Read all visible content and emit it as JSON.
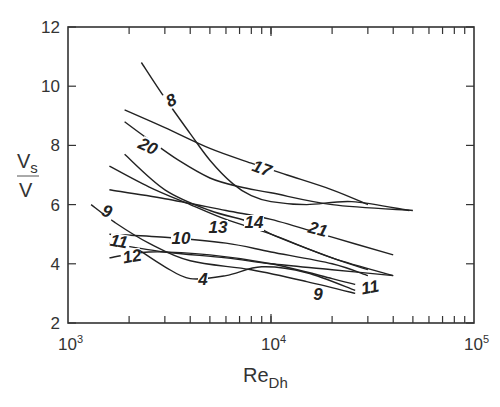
{
  "chart_data": {
    "type": "line",
    "title": "",
    "xlabel": "Re_Dh",
    "xlabel_main": "Re",
    "xlabel_sub": "Dh",
    "ylabel": "Vs/V",
    "ylabel_num": "V",
    "ylabel_num_sub": "s",
    "ylabel_den": "V",
    "xscale": "log",
    "xlim": [
      1000,
      100000
    ],
    "ylim": [
      2,
      12
    ],
    "xticks": [
      {
        "value": 1000,
        "base": "10",
        "exp": "3"
      },
      {
        "value": 10000,
        "base": "10",
        "exp": "4"
      },
      {
        "value": 100000,
        "base": "10",
        "exp": "5"
      }
    ],
    "yticks": [
      "2",
      "4",
      "6",
      "8",
      "10",
      "12"
    ],
    "grid": false,
    "legend": "none (curves labeled inline)",
    "series": [
      {
        "name": "8",
        "points": [
          [
            2300,
            10.8
          ],
          [
            3000,
            9.6
          ],
          [
            4000,
            8.4
          ],
          [
            5000,
            7.5
          ],
          [
            6500,
            6.7
          ],
          [
            8000,
            6.3
          ],
          [
            10000,
            6.1
          ],
          [
            15000,
            6.0
          ],
          [
            25000,
            6.1
          ],
          [
            48000,
            5.8
          ]
        ]
      },
      {
        "name": "17",
        "points": [
          [
            1900,
            9.2
          ],
          [
            3000,
            8.6
          ],
          [
            5000,
            7.9
          ],
          [
            8000,
            7.4
          ],
          [
            12000,
            7.0
          ],
          [
            20000,
            6.5
          ],
          [
            30000,
            6.0
          ]
        ]
      },
      {
        "name": "20",
        "points": [
          [
            1900,
            8.8
          ],
          [
            2500,
            8.2
          ],
          [
            3500,
            7.5
          ],
          [
            5000,
            6.9
          ],
          [
            7000,
            6.6
          ],
          [
            10000,
            6.4
          ],
          [
            20000,
            6.0
          ],
          [
            50000,
            5.8
          ]
        ]
      },
      {
        "name": "21",
        "points": [
          [
            1600,
            6.5
          ],
          [
            3000,
            6.2
          ],
          [
            6000,
            5.8
          ],
          [
            10000,
            5.5
          ],
          [
            20000,
            4.9
          ],
          [
            40000,
            4.3
          ]
        ]
      },
      {
        "name": "14",
        "points": [
          [
            1900,
            7.7
          ],
          [
            3000,
            6.5
          ],
          [
            5000,
            5.8
          ],
          [
            8000,
            5.4
          ],
          [
            10000,
            5.0
          ],
          [
            20000,
            4.2
          ],
          [
            30000,
            3.8
          ]
        ]
      },
      {
        "name": "13",
        "points": [
          [
            1600,
            7.3
          ],
          [
            2500,
            6.6
          ],
          [
            4000,
            6.0
          ],
          [
            6000,
            5.5
          ],
          [
            10000,
            5.0
          ],
          [
            20000,
            4.2
          ],
          [
            40000,
            3.6
          ]
        ]
      },
      {
        "name": "9",
        "points": [
          [
            1300,
            6.0
          ],
          [
            1700,
            5.4
          ],
          [
            2500,
            4.7
          ],
          [
            4000,
            4.1
          ],
          [
            8000,
            3.8
          ],
          [
            15000,
            3.4
          ],
          [
            26000,
            3.0
          ]
        ]
      },
      {
        "name": "10",
        "points": [
          [
            1600,
            5.0
          ],
          [
            3000,
            4.9
          ],
          [
            6000,
            4.7
          ],
          [
            10000,
            4.4
          ],
          [
            20000,
            4.0
          ],
          [
            30000,
            3.6
          ]
        ]
      },
      {
        "name": "11",
        "points": [
          [
            1600,
            4.7
          ],
          [
            3000,
            4.4
          ],
          [
            6000,
            4.2
          ],
          [
            10000,
            4.0
          ],
          [
            20000,
            3.8
          ],
          [
            40000,
            3.6
          ]
        ]
      },
      {
        "name": "12",
        "points": [
          [
            1600,
            4.2
          ],
          [
            2500,
            4.4
          ],
          [
            5000,
            4.3
          ],
          [
            10000,
            4.0
          ],
          [
            20000,
            3.5
          ],
          [
            26000,
            3.3
          ]
        ]
      },
      {
        "name": "4",
        "points": [
          [
            2200,
            4.5
          ],
          [
            3000,
            3.9
          ],
          [
            4000,
            3.5
          ],
          [
            6000,
            3.6
          ],
          [
            9000,
            3.9
          ],
          [
            15000,
            3.7
          ],
          [
            26000,
            3.1
          ]
        ]
      }
    ],
    "labels": [
      {
        "text": "8",
        "x": 171,
        "y": 106,
        "rot": -25
      },
      {
        "text": "20",
        "x": 148,
        "y": 152,
        "rot": 25
      },
      {
        "text": "17",
        "x": 262,
        "y": 174,
        "rot": 20
      },
      {
        "text": "9",
        "x": 107,
        "y": 217,
        "rot": 20
      },
      {
        "text": "13",
        "x": 218,
        "y": 233,
        "rot": 0
      },
      {
        "text": "14",
        "x": 254,
        "y": 228,
        "rot": 0
      },
      {
        "text": "21",
        "x": 318,
        "y": 235,
        "rot": 15
      },
      {
        "text": "10",
        "x": 181,
        "y": 244,
        "rot": 0
      },
      {
        "text": "11",
        "x": 119,
        "y": 247,
        "rot": 10
      },
      {
        "text": "12",
        "x": 132,
        "y": 262,
        "rot": -10
      },
      {
        "text": "4",
        "x": 203,
        "y": 285,
        "rot": 0
      },
      {
        "text": "9",
        "x": 318,
        "y": 300,
        "rot": 0
      },
      {
        "text": "11",
        "x": 370,
        "y": 293,
        "rot": -10
      }
    ]
  }
}
